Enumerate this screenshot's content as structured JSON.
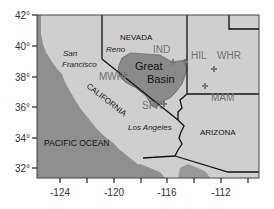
{
  "map": {
    "type": "regional map",
    "colors": {
      "ocean": "#8f8f8f",
      "land": "#cfcfcf",
      "great_basin": "#8a8a8a",
      "border": "#111111",
      "site_marker": "#777777",
      "site_label": "#707070"
    },
    "axes": {
      "x_ticks": [
        "-124",
        "-120",
        "-116",
        "-112"
      ],
      "y_ticks": [
        "42°",
        "40°",
        "38°",
        "36°",
        "34°",
        "32°"
      ]
    },
    "labels": {
      "ocean": "PACIFIC OCEAN",
      "states": {
        "nevada": "NEVADA",
        "california": "CALIFORNIA",
        "arizona": "ARIZONA"
      },
      "cities": {
        "san_francisco_line1": "San",
        "san_francisco_line2": "Francisco",
        "reno": "Reno",
        "los_angeles": "Los Angeles"
      },
      "region": {
        "line1": "Great",
        "line2": "Basin"
      },
      "sites": {
        "ind": "IND",
        "mwk": "MWK",
        "spr": "SPR",
        "hil": "HIL",
        "whr": "WHR",
        "mam": "MAM"
      }
    }
  }
}
